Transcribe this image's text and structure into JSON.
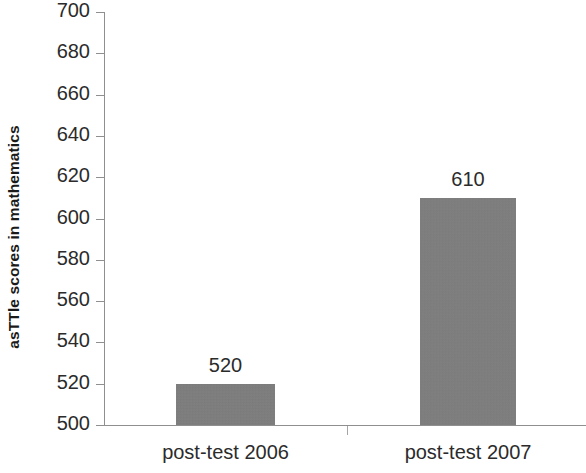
{
  "chart_data": {
    "type": "bar",
    "title": "",
    "subtitle": "",
    "xlabel": "",
    "ylabel": "asTTle scores in mathematics",
    "categories": [
      "post-test 2006",
      "post-test 2007"
    ],
    "values": [
      520,
      610
    ],
    "data_labels": [
      "520",
      "610"
    ],
    "ylim": [
      500,
      700
    ],
    "ytick_step": 20,
    "ytick_labels": [
      "700",
      "680",
      "660",
      "640",
      "620",
      "600",
      "580",
      "560",
      "540",
      "520",
      "500"
    ],
    "ytick_values": [
      700,
      680,
      660,
      640,
      620,
      600,
      580,
      560,
      540,
      520,
      500
    ],
    "grid": false,
    "legend": false,
    "legend_position": "none",
    "bar_color": "#7e7e7e",
    "axis_color": "#8f8f8f",
    "text_color": "#2b2b2b",
    "background_color": "#ffffff"
  }
}
